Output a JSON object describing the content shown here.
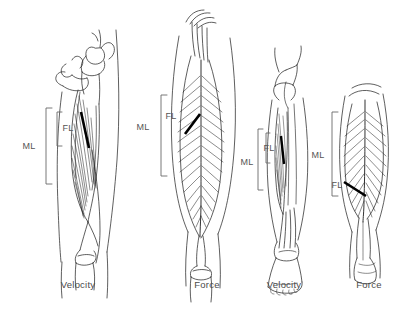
{
  "figure": {
    "background_color": "#ffffff",
    "line_color": "#1a1a1a",
    "label_color": "#555555",
    "caption_color": "#4a4a4a",
    "fiber_marker_color": "#000000"
  },
  "abbreviations": {
    "fl": "FL",
    "ml": "ML"
  },
  "panels": [
    {
      "id": "panel-1",
      "caption": "Velocity",
      "caption_x": 78,
      "region": "thigh",
      "muscle": "long-fibered thigh muscle",
      "view": "anterior-lateral",
      "fl_label": "FL",
      "ml_label": "ML",
      "fl_label_x": 68,
      "fl_label_y": 128,
      "ml_label_x": 29,
      "ml_label_y": 146,
      "ml_bracket": {
        "x": 46,
        "top": 108,
        "bottom": 184,
        "tick": 6
      },
      "fl_bracket": {
        "x": 57,
        "top": 112,
        "bottom": 146,
        "tick": 5
      }
    },
    {
      "id": "panel-2",
      "caption": "Force",
      "caption_x": 207,
      "region": "thigh",
      "muscle": "bipennate thigh muscle",
      "view": "anterior",
      "fl_label": "FL",
      "ml_label": "ML",
      "fl_label_x": 171,
      "fl_label_y": 116,
      "ml_label_x": 143,
      "ml_label_y": 127,
      "ml_bracket": {
        "x": 161,
        "top": 95,
        "bottom": 176,
        "tick": 6
      },
      "fl_bracket": null
    },
    {
      "id": "panel-3",
      "caption": "Velocity",
      "caption_x": 284,
      "region": "lower-leg",
      "muscle": "long-fibered lower leg muscle",
      "view": "anterior",
      "fl_label": "FL",
      "ml_label": "ML",
      "fl_label_x": 269,
      "fl_label_y": 148,
      "ml_label_x": 247,
      "ml_label_y": 162,
      "ml_bracket": {
        "x": 258,
        "top": 129,
        "bottom": 190,
        "tick": 5
      },
      "fl_bracket": {
        "x": 266,
        "top": 133,
        "bottom": 163,
        "tick": 4
      }
    },
    {
      "id": "panel-4",
      "caption": "Force",
      "caption_x": 369,
      "region": "lower-leg",
      "muscle": "bipennate calf muscle",
      "view": "posterior",
      "fl_label": "FL",
      "ml_label": "ML",
      "fl_label_x": 337,
      "fl_label_y": 185,
      "ml_label_x": 318,
      "ml_label_y": 155,
      "ml_bracket": {
        "x": 332,
        "top": 112,
        "bottom": 196,
        "tick": 6
      },
      "fl_bracket": null
    }
  ]
}
